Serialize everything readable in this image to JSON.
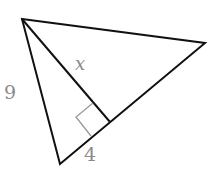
{
  "diagram": {
    "type": "right-triangle-altitude",
    "vertices": {
      "A": [
        22,
        19
      ],
      "B": [
        205,
        43
      ],
      "C": [
        60,
        164
      ],
      "D_foot": [
        110,
        122
      ]
    },
    "labels": {
      "side_AC": "9",
      "altitude_AD": "x",
      "segment_CD": "4"
    },
    "colors": {
      "line": "#111111",
      "label": "#8a8a8a",
      "right_angle_marker": "#999999"
    }
  }
}
